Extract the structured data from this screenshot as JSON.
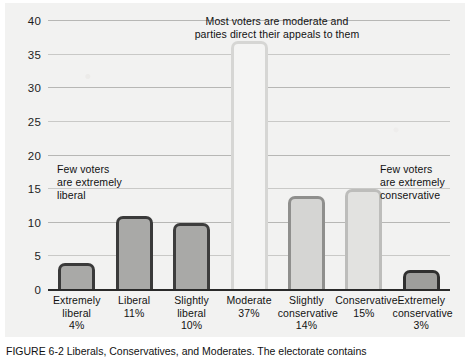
{
  "figure": {
    "caption": "FIGURE 6-2 Liberals, Conservatives, and Moderates. The electorate contains",
    "caption_label": "FIGURE 6-2"
  },
  "chart_data": {
    "type": "bar",
    "title": "",
    "xlabel": "",
    "ylabel": "",
    "ylim": [
      0,
      40
    ],
    "yticks": [
      0,
      5,
      10,
      15,
      20,
      25,
      30,
      35,
      40
    ],
    "ytick_labels": [
      "0",
      "5",
      "10",
      "15",
      "20",
      "25",
      "30",
      "35",
      "40"
    ],
    "grid": true,
    "legend": "none",
    "categories": [
      "Extremely liberal",
      "Liberal",
      "Slightly liberal",
      "Moderate",
      "Slightly conservative",
      "Conservative",
      "Extremely conservative"
    ],
    "values": [
      4,
      11,
      10,
      37,
      14,
      15,
      3
    ],
    "value_labels": [
      "4%",
      "11%",
      "10%",
      "37%",
      "14%",
      "15%",
      "3%"
    ],
    "bars": [
      {
        "name": "Extremely liberal",
        "line1": "Extremely",
        "line2": "liberal",
        "line3": "4%",
        "value": 4,
        "fill": "#a9a9a7",
        "stroke": "#3a3a3a",
        "stroke_width": 3
      },
      {
        "name": "Liberal",
        "line1": "Liberal",
        "line2": "11%",
        "line3": "",
        "value": 11,
        "fill": "#a9a9a7",
        "stroke": "#3a3a3a",
        "stroke_width": 3
      },
      {
        "name": "Slightly liberal",
        "line1": "Slightly",
        "line2": "liberal",
        "line3": "10%",
        "value": 10,
        "fill": "#a9a9a7",
        "stroke": "#3d3d3d",
        "stroke_width": 3
      },
      {
        "name": "Moderate",
        "line1": "Moderate",
        "line2": "37%",
        "line3": "",
        "value": 37,
        "fill": "#f4f4f3",
        "stroke": "#d6d6d4",
        "stroke_width": 3
      },
      {
        "name": "Slightly conservative",
        "line1": "Slightly",
        "line2": "conservative",
        "line3": "14%",
        "value": 14,
        "fill": "#d5d5d3",
        "stroke": "#8f8f8d",
        "stroke_width": 3
      },
      {
        "name": "Conservative",
        "line1": "Conservative",
        "line2": "15%",
        "line3": "",
        "value": 15,
        "fill": "#e2e2e0",
        "stroke": "#bdbdbb",
        "stroke_width": 3
      },
      {
        "name": "Extremely conservative",
        "line1": "Extremely",
        "line2": "conservative",
        "line3": "3%",
        "value": 3,
        "fill": "#9e9e9c",
        "stroke": "#2f2f2f",
        "stroke_width": 3
      }
    ],
    "annotations": [
      {
        "name": "left-note",
        "line1": "Few voters",
        "line2": "are extremely",
        "line3": "liberal"
      },
      {
        "name": "center-note",
        "line1": "Most voters are moderate and",
        "line2": "parties direct their appeals to them",
        "line3": ""
      },
      {
        "name": "right-note",
        "line1": "Few voters",
        "line2": "are extremely",
        "line3": "conservative"
      }
    ]
  },
  "colors": {
    "page_background": "#f2f2f1",
    "gridline": "#b7b7b5",
    "axis": "#2a2a2a",
    "text": "#111111"
  }
}
